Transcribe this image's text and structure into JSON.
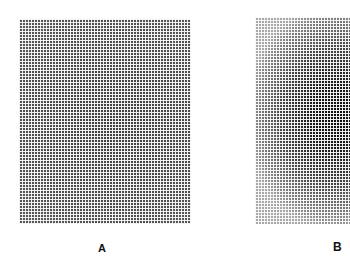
{
  "figure": {
    "panels": [
      {
        "label": "A",
        "description": "halftone grid, uniform mid-gray"
      },
      {
        "label": "B",
        "description": "halftone grid, dark central blob fading to lighter edges"
      }
    ]
  }
}
